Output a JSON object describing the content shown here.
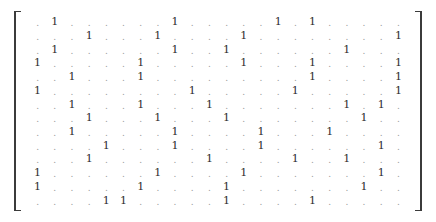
{
  "figure": {
    "kind": "sparse-binary-matrix",
    "zero_glyph": ".",
    "one_glyph": "1",
    "rows": 14,
    "cols": 22,
    "bracket_left": "[",
    "bracket_right": "]",
    "colors": {
      "zero": "#9a9a9a",
      "one": "#2e2e2e",
      "bracket": "#3b3b3b",
      "background": "#ffffff"
    }
  },
  "chart_data": {
    "type": "heatmap",
    "title": "",
    "xlabel": "",
    "ylabel": "",
    "rows": 14,
    "cols": 22,
    "legend": [],
    "grid": false,
    "matrix": [
      [
        0,
        1,
        0,
        0,
        0,
        0,
        0,
        0,
        1,
        0,
        0,
        0,
        0,
        0,
        1,
        0,
        1,
        0,
        0,
        0,
        0,
        0
      ],
      [
        0,
        0,
        0,
        1,
        0,
        0,
        0,
        1,
        0,
        0,
        0,
        0,
        1,
        0,
        0,
        0,
        0,
        0,
        0,
        0,
        0,
        1
      ],
      [
        0,
        1,
        0,
        0,
        0,
        0,
        0,
        0,
        1,
        0,
        0,
        1,
        0,
        0,
        0,
        0,
        0,
        0,
        1,
        0,
        0,
        0
      ],
      [
        1,
        0,
        0,
        0,
        0,
        0,
        1,
        0,
        0,
        0,
        0,
        0,
        1,
        0,
        0,
        0,
        1,
        0,
        0,
        0,
        0,
        1
      ],
      [
        0,
        0,
        1,
        0,
        0,
        0,
        1,
        0,
        0,
        0,
        0,
        0,
        0,
        0,
        0,
        0,
        1,
        0,
        0,
        0,
        0,
        1
      ],
      [
        1,
        0,
        0,
        0,
        0,
        0,
        0,
        0,
        0,
        1,
        0,
        0,
        0,
        0,
        0,
        1,
        0,
        0,
        0,
        0,
        0,
        1
      ],
      [
        0,
        0,
        1,
        0,
        0,
        0,
        1,
        0,
        0,
        0,
        1,
        0,
        0,
        0,
        0,
        0,
        0,
        0,
        1,
        0,
        1,
        0
      ],
      [
        0,
        0,
        0,
        1,
        0,
        0,
        0,
        1,
        0,
        0,
        0,
        1,
        0,
        0,
        0,
        0,
        0,
        0,
        0,
        1,
        0,
        0
      ],
      [
        0,
        0,
        1,
        0,
        0,
        0,
        0,
        0,
        1,
        0,
        0,
        0,
        0,
        1,
        0,
        0,
        0,
        1,
        0,
        0,
        0,
        0
      ],
      [
        0,
        0,
        0,
        0,
        1,
        0,
        0,
        0,
        1,
        0,
        0,
        0,
        0,
        1,
        0,
        0,
        0,
        0,
        0,
        0,
        1,
        0
      ],
      [
        0,
        0,
        0,
        1,
        0,
        0,
        0,
        0,
        0,
        0,
        1,
        0,
        0,
        0,
        0,
        1,
        0,
        0,
        1,
        0,
        0,
        0
      ],
      [
        1,
        0,
        0,
        0,
        0,
        0,
        0,
        1,
        0,
        0,
        0,
        0,
        1,
        0,
        0,
        0,
        0,
        0,
        0,
        0,
        1,
        0
      ],
      [
        1,
        0,
        0,
        0,
        0,
        0,
        1,
        0,
        0,
        0,
        0,
        1,
        0,
        0,
        0,
        0,
        0,
        0,
        0,
        1,
        0,
        0
      ],
      [
        0,
        0,
        0,
        0,
        1,
        1,
        0,
        0,
        0,
        0,
        0,
        1,
        0,
        0,
        0,
        0,
        1,
        0,
        0,
        0,
        0,
        0
      ]
    ]
  }
}
